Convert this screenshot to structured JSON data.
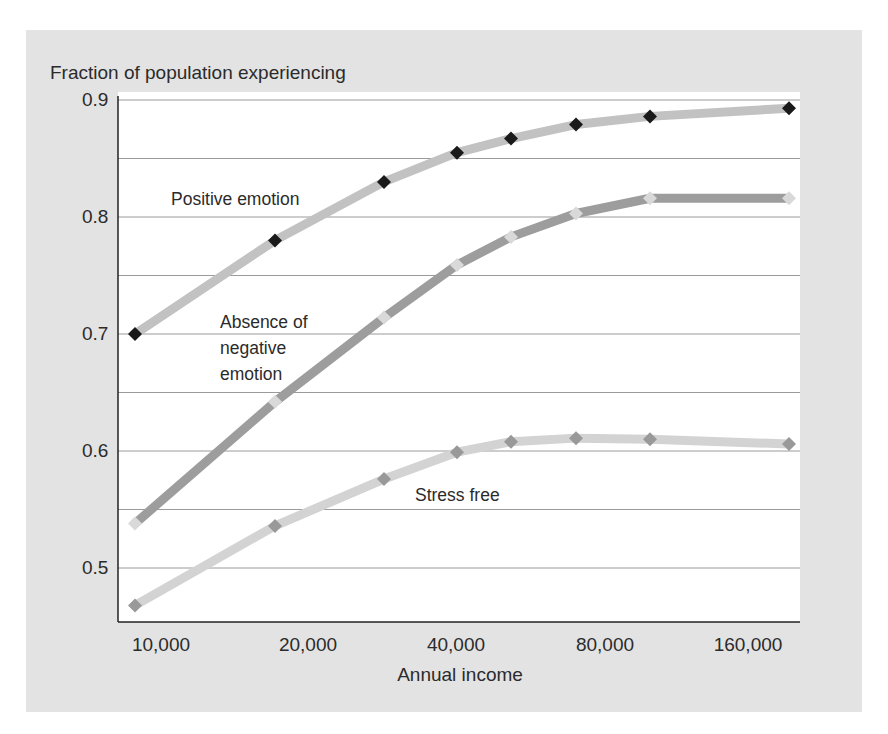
{
  "chart_data": {
    "type": "line",
    "title": "Fraction of population experiencing",
    "xlabel": "Annual income",
    "ylabel": "Fraction of population experiencing",
    "x_scale": "log2",
    "x_tick_labels": [
      "10,000",
      "20,000",
      "40,000",
      "80,000",
      "160,000"
    ],
    "x_tick_values": [
      10000,
      20000,
      40000,
      80000,
      160000
    ],
    "y_tick_labels": [
      "0.9",
      "0.8",
      "0.7",
      "0.6",
      "0.5"
    ],
    "y_tick_values": [
      0.9,
      0.8,
      0.7,
      0.6,
      0.5
    ],
    "ylim": [
      0.455,
      0.915
    ],
    "gridlines": [
      0.9,
      0.85,
      0.8,
      0.75,
      0.7,
      0.65,
      0.6,
      0.55,
      0.5
    ],
    "grid": true,
    "legend": "inline labels",
    "x": [
      8850,
      17100,
      28600,
      40400,
      52000,
      70700,
      100000,
      193000
    ],
    "series": [
      {
        "name": "Positive emotion",
        "values": [
          0.7,
          0.78,
          0.83,
          0.855,
          0.867,
          0.879,
          0.886,
          0.893
        ],
        "line_color": "#c2c2c2",
        "marker_color": "#1a1a1a"
      },
      {
        "name": "Absence of negative emotion",
        "values": [
          0.538,
          0.642,
          0.714,
          0.759,
          0.783,
          0.803,
          0.816,
          0.816
        ],
        "line_color": "#9d9d9d",
        "marker_color": "#d9d9d9"
      },
      {
        "name": "Stress free",
        "values": [
          0.468,
          0.536,
          0.576,
          0.599,
          0.608,
          0.611,
          0.61,
          0.606
        ],
        "line_color": "#d3d3d3",
        "marker_color": "#999999"
      }
    ],
    "annotations": [
      {
        "text": "Positive emotion",
        "series": 0
      },
      {
        "text": "Absence of negative emotion",
        "series": 1
      },
      {
        "text": "Stress free",
        "series": 2
      }
    ]
  },
  "labels": {
    "title": "Fraction of population experiencing",
    "xlabel": "Annual income",
    "positive": "Positive emotion",
    "absence_1": "Absence of",
    "absence_2": "negative",
    "absence_3": "emotion",
    "stress": "Stress free",
    "y0": "0.9",
    "y1": "0.8",
    "y2": "0.7",
    "y3": "0.6",
    "y4": "0.5",
    "x0": "10,000",
    "x1": "20,000",
    "x2": "40,000",
    "x3": "80,000",
    "x4": "160,000"
  },
  "layout_px": {
    "x_positions": [
      135,
      275,
      384,
      457,
      511,
      576,
      650,
      789
    ]
  }
}
